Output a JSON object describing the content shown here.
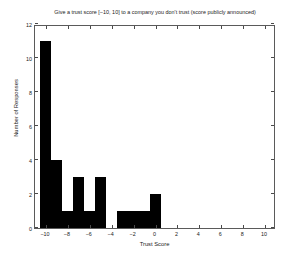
{
  "chart_data": {
    "type": "bar",
    "title": "Give a trust score [−10, 10] to a company you don't trust (score publicly announced)",
    "xlabel": "Trust Score",
    "ylabel": "Number of Responses",
    "categories": [
      -10,
      -9,
      -8,
      -7,
      -6,
      -5,
      -4,
      -3,
      -2,
      -1,
      0,
      1,
      2,
      3,
      4,
      5,
      6,
      7,
      8,
      9,
      10
    ],
    "values": [
      11,
      4,
      1,
      3,
      1,
      3,
      0,
      1,
      1,
      1,
      2,
      0,
      0,
      0,
      0,
      0,
      0,
      0,
      0,
      0,
      0
    ],
    "xlim": [
      -11,
      11
    ],
    "ylim": [
      0,
      12
    ],
    "xticks": [
      -10,
      -8,
      -6,
      -4,
      -2,
      0,
      2,
      4,
      6,
      8,
      10
    ],
    "xtick_labels": [
      "−10",
      "−8",
      "−6",
      "−4",
      "−2",
      "0",
      "2",
      "4",
      "6",
      "8",
      "10"
    ],
    "yticks": [
      0,
      2,
      4,
      6,
      8,
      10,
      12
    ],
    "ytick_labels": [
      "0",
      "2",
      "4",
      "6",
      "8",
      "10",
      "12"
    ],
    "grid": false,
    "legend": null,
    "bar_color": "#000000",
    "axis_color": "#5a5a5a",
    "background": "#ffffff"
  }
}
